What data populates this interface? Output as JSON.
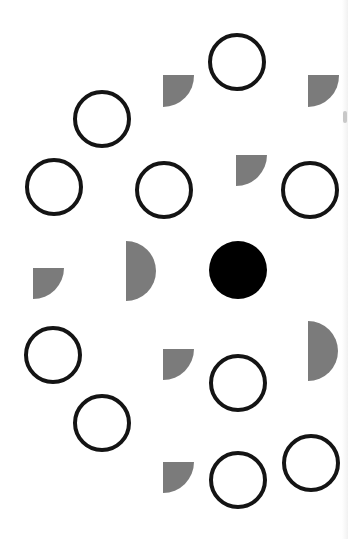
{
  "canvas": {
    "width": 348,
    "height": 539,
    "background": "#ffffff"
  },
  "colors": {
    "outline": "#141414",
    "filled": "#000000",
    "gray": "#7b7b7b"
  },
  "stroke_width": 4,
  "hollow_circles": [
    {
      "cx": 237,
      "cy": 62,
      "r": 27
    },
    {
      "cx": 102,
      "cy": 119,
      "r": 27
    },
    {
      "cx": 54,
      "cy": 187,
      "r": 27
    },
    {
      "cx": 164,
      "cy": 190,
      "r": 27
    },
    {
      "cx": 310,
      "cy": 190,
      "r": 27
    },
    {
      "cx": 53,
      "cy": 355,
      "r": 27
    },
    {
      "cx": 238,
      "cy": 383,
      "r": 27
    },
    {
      "cx": 102,
      "cy": 423,
      "r": 27
    },
    {
      "cx": 238,
      "cy": 480,
      "r": 27
    },
    {
      "cx": 311,
      "cy": 463,
      "r": 27
    }
  ],
  "filled_circles": [
    {
      "cx": 238,
      "cy": 270,
      "r": 29
    }
  ],
  "gray_semicircles": [
    {
      "x": 126,
      "y": 241,
      "r": 30
    },
    {
      "x": 308,
      "y": 321,
      "r": 30
    }
  ],
  "gray_partial_semicircles": [
    {
      "x": 163,
      "y": 75,
      "r": 31,
      "h": 32
    },
    {
      "x": 308,
      "y": 75,
      "r": 31,
      "h": 32
    },
    {
      "x": 236,
      "y": 155,
      "r": 31,
      "h": 31
    },
    {
      "x": 33,
      "y": 268,
      "r": 31,
      "h": 31
    },
    {
      "x": 163,
      "y": 349,
      "r": 31,
      "h": 31
    },
    {
      "x": 163,
      "y": 462,
      "r": 31,
      "h": 31
    }
  ]
}
